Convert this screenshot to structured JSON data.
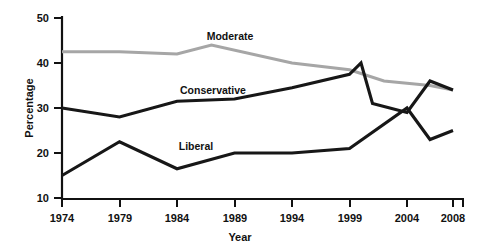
{
  "chart_data": {
    "type": "line",
    "title": "",
    "xlabel": "Year",
    "ylabel": "Percentage",
    "xlim": [
      1974,
      2008
    ],
    "ylim": [
      10,
      50
    ],
    "xticks": [
      1974,
      1979,
      1984,
      1989,
      1994,
      1999,
      2004,
      2008
    ],
    "xtick_labels": [
      "1974",
      "1979",
      "1984",
      "1989",
      "1994",
      "1999",
      "2004",
      "2008"
    ],
    "yticks": [
      10,
      20,
      30,
      40,
      50
    ],
    "ytick_labels": [
      "10",
      "20",
      "30",
      "40",
      "50"
    ],
    "grid": false,
    "legend": "inline-labels",
    "series": [
      {
        "name": "Moderate",
        "color": "#a6a6a6",
        "label_text": "Moderate",
        "x": [
          1974,
          1979,
          1984,
          1987,
          1994,
          1999,
          2002,
          2004,
          2006,
          2008
        ],
        "values": [
          42.5,
          42.5,
          42,
          44,
          40,
          38.5,
          36,
          35.5,
          35,
          34
        ]
      },
      {
        "name": "Conservative",
        "color": "#171717",
        "label_text": "Conservative",
        "x": [
          1974,
          1979,
          1984,
          1989,
          1994,
          1999,
          2000,
          2001,
          2004,
          2006,
          2008
        ],
        "values": [
          30,
          28,
          31.5,
          32,
          34.5,
          37.5,
          40,
          31,
          29,
          36,
          34
        ]
      },
      {
        "name": "Liberal",
        "color": "#171717",
        "label_text": "Liberal",
        "x": [
          1974,
          1979,
          1984,
          1989,
          1994,
          1999,
          2004,
          2006,
          2008
        ],
        "values": [
          15,
          22.5,
          16.5,
          20,
          20,
          21,
          30,
          23,
          25
        ]
      }
    ],
    "annotations": [
      {
        "text": "Moderate",
        "x": 1992,
        "y": 46.5
      },
      {
        "text": "Conservative",
        "x": 1987.5,
        "y": 34.5
      },
      {
        "text": "Liberal",
        "x": 1986.5,
        "y": 22.5
      }
    ]
  }
}
